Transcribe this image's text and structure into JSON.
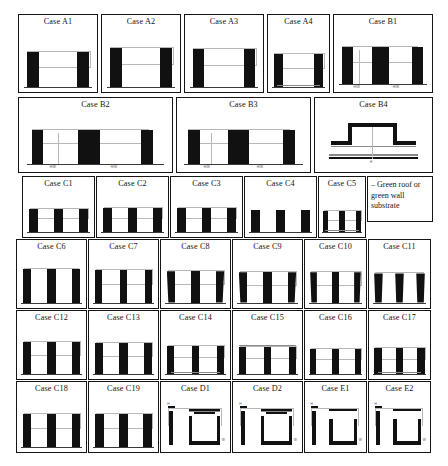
{
  "figure": {
    "legend": {
      "name": "substrate-legend",
      "text": "– Green roof or green wall substrate"
    },
    "rows": [
      {
        "id": "row-a",
        "cases": [
          {
            "id": "A1",
            "label": "Case A1",
            "type": "canyon",
            "bars": 2,
            "bar_h": 0.55,
            "bar_w": 0.16,
            "gap": 0.4,
            "ground": true,
            "substrate": "none",
            "dim": "inner",
            "shape": "rect"
          },
          {
            "id": "A2",
            "label": "Case A2",
            "type": "canyon",
            "bars": 2,
            "bar_h": 0.62,
            "bar_w": 0.16,
            "gap": 0.38,
            "ground": true,
            "substrate": "none",
            "dim": "inner",
            "shape": "rect"
          },
          {
            "id": "A3",
            "label": "Case A3",
            "type": "canyon",
            "bars": 2,
            "bar_h": 0.6,
            "bar_w": 0.15,
            "gap": 0.44,
            "ground": true,
            "substrate": "none",
            "dim": "inner",
            "shape": "rect"
          },
          {
            "id": "A4",
            "label": "Case A4",
            "type": "canyon",
            "bars": 2,
            "bar_h": 0.52,
            "bar_w": 0.15,
            "gap": 0.5,
            "ground": true,
            "substrate": "road",
            "dim": "inner",
            "shape": "rect"
          },
          {
            "id": "B1",
            "label": "Case B1",
            "type": "double-canyon",
            "bars": 4,
            "bar_h": 0.58,
            "bar_w": 0.11,
            "ground": true,
            "substrate": "none",
            "dim": "dual",
            "shape": "rect"
          }
        ]
      },
      {
        "id": "row-b",
        "cases": [
          {
            "id": "B2",
            "label": "Case B2",
            "type": "double-canyon",
            "bars": 4,
            "bar_h": 0.56,
            "bar_w": 0.075,
            "ground": true,
            "substrate": "none",
            "dim": "dual",
            "shape": "rect"
          },
          {
            "id": "B3",
            "label": "Case B3",
            "type": "double-canyon",
            "bars": 4,
            "bar_h": 0.56,
            "bar_w": 0.085,
            "ground": true,
            "substrate": "none",
            "dim": "dual",
            "shape": "rect"
          },
          {
            "id": "B4",
            "label": "Case B4",
            "type": "plateau",
            "bars": 0,
            "ground": true,
            "substrate": "roof-and-road",
            "dim": "center",
            "shape": "step"
          }
        ]
      },
      {
        "id": "row-c1",
        "cases": [
          {
            "id": "C1",
            "label": "Case C1",
            "type": "canyon3",
            "bars": 3,
            "bar_h": 0.5,
            "bar_w": 0.12,
            "ground": true,
            "substrate": "none",
            "dim": "inner",
            "shape": "rect"
          },
          {
            "id": "C2",
            "label": "Case C2",
            "type": "canyon3",
            "bars": 3,
            "bar_h": 0.52,
            "bar_w": 0.12,
            "ground": true,
            "substrate": "none",
            "dim": "inner",
            "shape": "rect"
          },
          {
            "id": "C3",
            "label": "Case C3",
            "type": "canyon3",
            "bars": 3,
            "bar_h": 0.52,
            "bar_w": 0.12,
            "ground": true,
            "substrate": "none",
            "dim": "inner",
            "shape": "rect"
          },
          {
            "id": "C4",
            "label": "Case C4",
            "type": "canyon3",
            "bars": 3,
            "bar_h": 0.46,
            "bar_w": 0.13,
            "ground": true,
            "substrate": "none",
            "dim": "none",
            "shape": "rect"
          },
          {
            "id": "C5",
            "label": "Case C5",
            "type": "canyon3",
            "bars": 3,
            "bar_h": 0.44,
            "bar_w": 0.11,
            "ground": true,
            "substrate": "road",
            "dim": "inner",
            "shape": "rect"
          }
        ]
      },
      {
        "id": "row-c2",
        "cases": [
          {
            "id": "C6",
            "label": "Case C6",
            "type": "canyon3",
            "bars": 3,
            "bar_h": 0.62,
            "bar_w": 0.12,
            "ground": true,
            "substrate": "none",
            "dim": "top-line",
            "shape": "rect"
          },
          {
            "id": "C7",
            "label": "Case C7",
            "type": "canyon3",
            "bars": 3,
            "bar_h": 0.6,
            "bar_w": 0.11,
            "ground": true,
            "substrate": "none",
            "dim": "inner",
            "shape": "rect"
          },
          {
            "id": "C8",
            "label": "Case C8",
            "type": "canyon3",
            "bars": 3,
            "bar_h": 0.58,
            "bar_w": 0.12,
            "ground": true,
            "substrate": "none",
            "dim": "inner",
            "shape": "taper"
          },
          {
            "id": "C9",
            "label": "Case C9",
            "type": "canyon3",
            "bars": 3,
            "bar_h": 0.56,
            "bar_w": 0.12,
            "ground": true,
            "substrate": "none",
            "dim": "inner",
            "shape": "taper"
          },
          {
            "id": "C10",
            "label": "Case C10",
            "type": "canyon3",
            "bars": 3,
            "bar_h": 0.56,
            "bar_w": 0.11,
            "ground": true,
            "substrate": "none",
            "dim": "inner",
            "shape": "taper"
          },
          {
            "id": "C11",
            "label": "Case C11",
            "type": "canyon3",
            "bars": 3,
            "bar_h": 0.54,
            "bar_w": 0.14,
            "ground": true,
            "substrate": "none",
            "dim": "top-line",
            "shape": "taper-wide"
          }
        ]
      },
      {
        "id": "row-c3",
        "cases": [
          {
            "id": "C12",
            "label": "Case C12",
            "type": "canyon3",
            "bars": 3,
            "bar_h": 0.58,
            "bar_w": 0.12,
            "ground": true,
            "substrate": "none",
            "dim": "inner",
            "shape": "rect"
          },
          {
            "id": "C13",
            "label": "Case C13",
            "type": "canyon3",
            "bars": 3,
            "bar_h": 0.56,
            "bar_w": 0.12,
            "ground": true,
            "substrate": "none",
            "dim": "inner",
            "shape": "rect"
          },
          {
            "id": "C14",
            "label": "Case C14",
            "type": "canyon3",
            "bars": 3,
            "bar_h": 0.52,
            "bar_w": 0.11,
            "ground": true,
            "substrate": "road",
            "dim": "inner",
            "shape": "rect"
          },
          {
            "id": "C15",
            "label": "Case C15",
            "type": "canyon3",
            "bars": 3,
            "bar_h": 0.5,
            "bar_w": 0.11,
            "ground": true,
            "substrate": "roof",
            "dim": "inner",
            "shape": "rect"
          },
          {
            "id": "C16",
            "label": "Case C16",
            "type": "canyon3",
            "bars": 3,
            "bar_h": 0.46,
            "bar_w": 0.1,
            "ground": true,
            "substrate": "none",
            "dim": "inner",
            "shape": "rect"
          },
          {
            "id": "C17",
            "label": "Case C17",
            "type": "canyon3",
            "bars": 3,
            "bar_h": 0.48,
            "bar_w": 0.12,
            "ground": true,
            "substrate": "road",
            "dim": "inner",
            "shape": "rect"
          }
        ]
      },
      {
        "id": "row-d",
        "cases": [
          {
            "id": "C18",
            "label": "Case C18",
            "type": "canyon3",
            "bars": 3,
            "bar_h": 0.58,
            "bar_w": 0.12,
            "ground": true,
            "substrate": "none",
            "dim": "inner",
            "shape": "rect"
          },
          {
            "id": "C19",
            "label": "Case C19",
            "type": "canyon3",
            "bars": 3,
            "bar_h": 0.58,
            "bar_w": 0.13,
            "ground": true,
            "substrate": "none",
            "dim": "inner",
            "shape": "rect"
          },
          {
            "id": "D1",
            "label": "Case D1",
            "type": "courtyard",
            "ground": false,
            "substrate": "roof",
            "dim": "inner",
            "shape": "u-open"
          },
          {
            "id": "D2",
            "label": "Case D2",
            "type": "courtyard",
            "ground": false,
            "substrate": "roof",
            "dim": "inner",
            "shape": "u-open"
          },
          {
            "id": "E1",
            "label": "Case E1",
            "type": "courtyard",
            "ground": false,
            "substrate": "none",
            "dim": "inner",
            "shape": "u-wide"
          },
          {
            "id": "E2",
            "label": "Case E2",
            "type": "courtyard",
            "ground": false,
            "substrate": "none",
            "dim": "inner",
            "shape": "u-wide"
          }
        ]
      }
    ]
  },
  "chart_data": {
    "type": "diagram-grid",
    "title": "",
    "case_labels": [
      "Case A1",
      "Case A2",
      "Case A3",
      "Case A4",
      "Case B1",
      "Case B2",
      "Case B3",
      "Case B4",
      "Case C1",
      "Case C2",
      "Case C3",
      "Case C4",
      "Case C5",
      "Case C6",
      "Case C7",
      "Case C8",
      "Case C9",
      "Case C10",
      "Case C11",
      "Case C12",
      "Case C13",
      "Case C14",
      "Case C15",
      "Case C16",
      "Case C17",
      "Case C18",
      "Case C19",
      "Case D1",
      "Case D2",
      "Case E1",
      "Case E2"
    ],
    "legend_entries": [
      "– Green roof or green wall substrate"
    ],
    "rows": 6,
    "total_cases": 31,
    "colors": {
      "building": "#111111",
      "substrate": "#8a8a8a",
      "dimension": "#b8b8b8",
      "border": "#151515"
    }
  }
}
